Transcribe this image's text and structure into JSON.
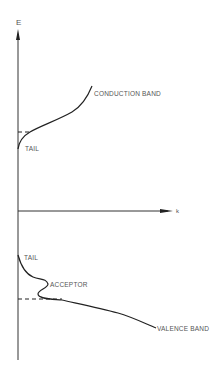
{
  "diagram": {
    "type": "band-structure",
    "axes": {
      "vertical_label": "E",
      "horizontal_label": "k"
    },
    "labels": {
      "conduction_tail": "TAIL",
      "conduction_band": "CONDUCTION BAND",
      "valence_tail": "TAIL",
      "acceptor": "ACCEPTOR",
      "valence_band": "VALENCE BAND"
    },
    "colors": {
      "line": "#222222",
      "text": "#555555",
      "background": "#ffffff"
    }
  }
}
